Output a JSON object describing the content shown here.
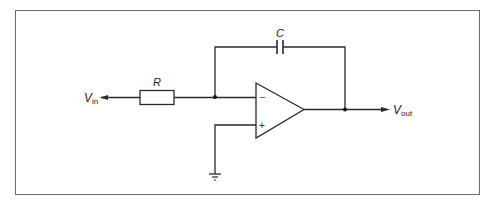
{
  "diagram": {
    "type": "circuit-schematic",
    "components": {
      "input": {
        "label": "V",
        "subscript": "in"
      },
      "resistor": {
        "label": "R"
      },
      "capacitor": {
        "label": "C"
      },
      "opamp": {
        "inverting": "−",
        "noninverting": "+"
      },
      "output": {
        "label": "V",
        "subscript": "out"
      },
      "ground": {
        "label": ""
      }
    }
  }
}
